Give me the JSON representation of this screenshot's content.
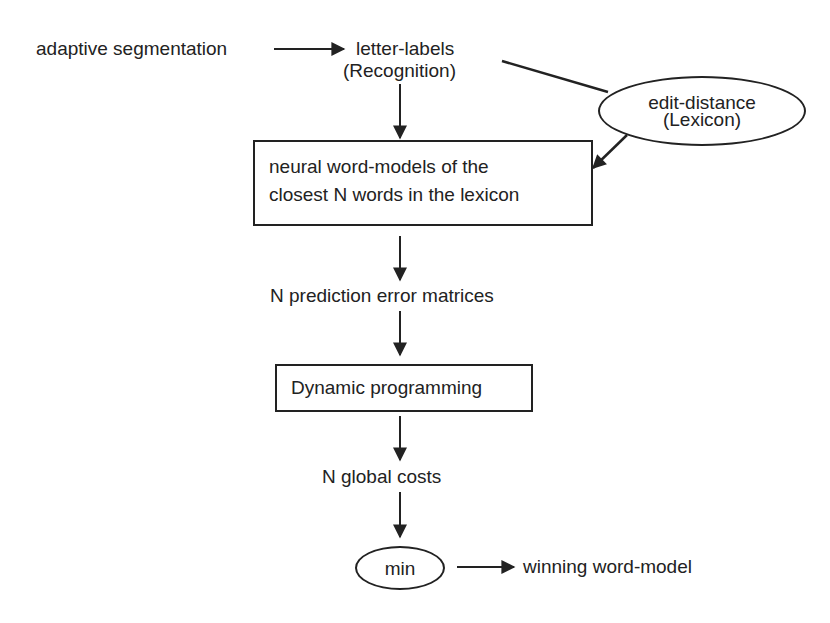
{
  "diagram": {
    "nodes": {
      "adaptive_segmentation": "adaptive segmentation",
      "letter_labels": "letter-labels",
      "recognition": "(Recognition)",
      "edit_distance": "edit-distance",
      "lexicon": "(Lexicon)",
      "word_models_line1": "neural word-models of the",
      "word_models_line2": "closest N words in the lexicon",
      "prediction_errors": "N prediction error matrices",
      "dynamic_programming": "Dynamic programming",
      "global_costs": "N global costs",
      "min": "min",
      "winning": "winning word-model"
    },
    "edges": [
      {
        "from": "adaptive segmentation",
        "to": "letter-labels"
      },
      {
        "from": "letter-labels",
        "to": "edit-distance"
      },
      {
        "from": "letter-labels",
        "to": "neural word-models"
      },
      {
        "from": "edit-distance",
        "to": "neural word-models"
      },
      {
        "from": "neural word-models",
        "to": "N prediction error matrices"
      },
      {
        "from": "N prediction error matrices",
        "to": "Dynamic programming"
      },
      {
        "from": "Dynamic programming",
        "to": "N global costs"
      },
      {
        "from": "N global costs",
        "to": "min"
      },
      {
        "from": "min",
        "to": "winning word-model"
      }
    ]
  }
}
